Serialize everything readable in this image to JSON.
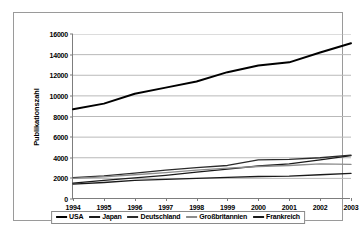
{
  "chart_data": {
    "type": "line",
    "title": "",
    "xlabel": "",
    "ylabel": "Publikationszahl",
    "x": [
      1994,
      1995,
      1996,
      1997,
      1998,
      1999,
      2000,
      2001,
      2002,
      2003
    ],
    "xticklabels": [
      "1994",
      "1995",
      "1996",
      "1997",
      "1998",
      "1999",
      "2000",
      "2001",
      "2002",
      "2003"
    ],
    "yticklabels": [
      "0",
      "2000",
      "4000",
      "6000",
      "8000",
      "10000",
      "12000",
      "14000",
      "16000"
    ],
    "ytickvalues": [
      0,
      2000,
      4000,
      6000,
      8000,
      10000,
      12000,
      14000,
      16000
    ],
    "ylim": [
      0,
      16000
    ],
    "grid": "horizontal",
    "legend_position": "bottom",
    "series": [
      {
        "name": "USA",
        "color": "#000000",
        "width": 2.0,
        "values": [
          8700,
          9250,
          10200,
          10800,
          11400,
          12300,
          12950,
          13250,
          14200,
          15100
        ]
      },
      {
        "name": "Japan",
        "color": "#1a1a1a",
        "width": 1.3,
        "values": [
          1530,
          1800,
          2050,
          2300,
          2600,
          2900,
          3200,
          3400,
          3800,
          4200
        ]
      },
      {
        "name": "Deutschland",
        "color": "#2b2b2b",
        "width": 1.3,
        "values": [
          2080,
          2250,
          2500,
          2800,
          3050,
          3250,
          3800,
          3850,
          4000,
          4250
        ]
      },
      {
        "name": "Großbritannien",
        "color": "#8c8c8c",
        "width": 1.3,
        "values": [
          2000,
          2150,
          2350,
          2550,
          2800,
          3000,
          3150,
          3250,
          3400,
          3350
        ]
      },
      {
        "name": "Frankreich",
        "color": "#1a1a1a",
        "width": 1.3,
        "values": [
          1450,
          1600,
          1800,
          1900,
          2000,
          2100,
          2180,
          2220,
          2350,
          2480
        ]
      }
    ]
  }
}
